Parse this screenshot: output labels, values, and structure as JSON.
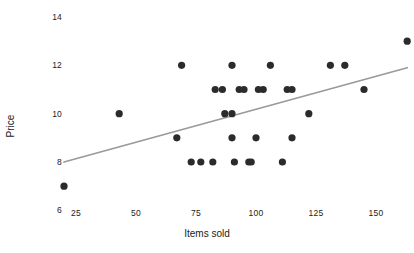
{
  "chart_data": {
    "type": "scatter",
    "title": "",
    "xlabel": "Items sold",
    "ylabel": "Price",
    "xlim": [
      18,
      170
    ],
    "ylim": [
      5.6,
      14.4
    ],
    "xticks": [
      25,
      50,
      75,
      100,
      125,
      150
    ],
    "yticks": [
      6,
      8,
      10,
      12,
      14
    ],
    "grid": false,
    "legend": null,
    "marker_color": "#2b2b2b",
    "marker_size": 3.6,
    "trendline": {
      "name": "linear fit",
      "color": "#9a9a9a",
      "width": 1.8,
      "x": [
        20,
        163
      ],
      "y": [
        8.0,
        11.9
      ]
    },
    "points": [
      {
        "x": 20,
        "y": 7
      },
      {
        "x": 43,
        "y": 10
      },
      {
        "x": 67,
        "y": 9
      },
      {
        "x": 69,
        "y": 12
      },
      {
        "x": 73,
        "y": 8
      },
      {
        "x": 77,
        "y": 8
      },
      {
        "x": 82,
        "y": 8
      },
      {
        "x": 83,
        "y": 11
      },
      {
        "x": 86,
        "y": 11
      },
      {
        "x": 87,
        "y": 10
      },
      {
        "x": 90,
        "y": 10
      },
      {
        "x": 90,
        "y": 12
      },
      {
        "x": 90,
        "y": 9
      },
      {
        "x": 91,
        "y": 8
      },
      {
        "x": 93,
        "y": 11
      },
      {
        "x": 95,
        "y": 11
      },
      {
        "x": 97,
        "y": 8
      },
      {
        "x": 98,
        "y": 8
      },
      {
        "x": 100,
        "y": 9
      },
      {
        "x": 101,
        "y": 11
      },
      {
        "x": 103,
        "y": 11
      },
      {
        "x": 106,
        "y": 12
      },
      {
        "x": 111,
        "y": 8
      },
      {
        "x": 113,
        "y": 11
      },
      {
        "x": 115,
        "y": 11
      },
      {
        "x": 115,
        "y": 9
      },
      {
        "x": 122,
        "y": 10
      },
      {
        "x": 131,
        "y": 12
      },
      {
        "x": 137,
        "y": 12
      },
      {
        "x": 145,
        "y": 11
      },
      {
        "x": 163,
        "y": 13
      }
    ]
  },
  "axes": {
    "x_tick_labels": [
      "25",
      "50",
      "75",
      "100",
      "125",
      "150"
    ],
    "y_tick_labels": [
      "6",
      "8",
      "10",
      "12",
      "14"
    ],
    "x_axis_title": "Items sold",
    "y_axis_title": "Price"
  }
}
